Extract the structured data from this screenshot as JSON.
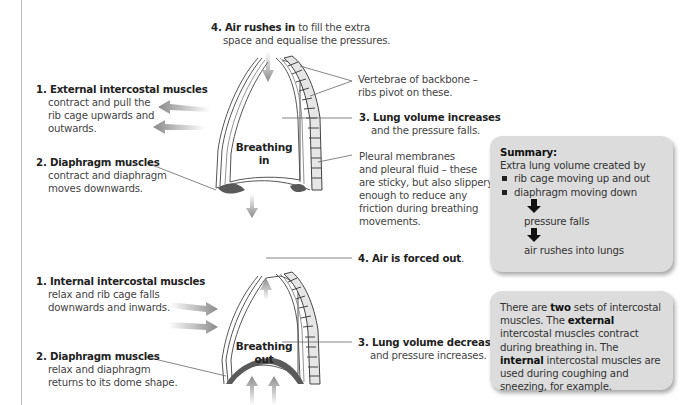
{
  "diagram": {
    "inhale": {
      "title": [
        "Breathing",
        "in"
      ],
      "labels": {
        "air": {
          "bold": "4. Air rushes in",
          "rest": " to fill the extra",
          "line2": "space and equalise the pressures."
        },
        "external": {
          "bold": "1. External intercostal muscles",
          "lines": [
            "contract and pull the",
            "rib cage upwards and",
            "outwards."
          ]
        },
        "diaphragm": {
          "bold": "2. Diaphragm muscles",
          "lines": [
            "contract and diaphragm",
            "moves downwards."
          ]
        },
        "vertebrae": {
          "lines": [
            "Vertebrae of backbone –",
            "ribs pivot on these."
          ]
        },
        "volume": {
          "bold": "3. Lung volume increases",
          "line2": "and the pressure falls."
        },
        "pleural": {
          "lines": [
            "Pleural membranes",
            "and pleural fluid – these",
            "are sticky, but also slippery",
            "enough to reduce any",
            "friction during breathing",
            "movements."
          ]
        }
      }
    },
    "exhale": {
      "title": [
        "Breathing",
        "out"
      ],
      "labels": {
        "air": {
          "bold": "4. Air is forced out",
          "rest": "."
        },
        "internal": {
          "bold": "1. Internal intercostal  muscles",
          "lines": [
            "relax and rib cage falls",
            "downwards and inwards."
          ]
        },
        "diaphragm": {
          "bold": "2. Diaphragm muscles",
          "lines": [
            "relax and diaphragm",
            "returns to its dome shape."
          ]
        },
        "volume": {
          "bold": "3. Lung volume decreases",
          "line2": "and pressure increases."
        }
      }
    }
  },
  "summary_box": {
    "title": "Summary:",
    "intro": "Extra lung volume created by",
    "bullets": [
      "rib cage moving up and out",
      "diaphragm moving down"
    ],
    "steps": [
      "pressure falls",
      "air rushes into lungs"
    ]
  },
  "note_box": {
    "t1": "There are ",
    "b1": "two",
    "t2": " sets of intercostal muscles. The ",
    "b2": "external",
    "t3": " intercostal muscles contract during breathing in. The ",
    "b3": "internal",
    "t4": " intercostal muscles are used during coughing and sneezing, for example."
  },
  "colors": {
    "box_fill": "#dcdcdc",
    "arrow_gray": "#8a8a8a",
    "vertebra_fill": "#e6e6e6",
    "diaphragm_dark": "#5a5a5a",
    "rule_line": "#bdbdbd"
  }
}
